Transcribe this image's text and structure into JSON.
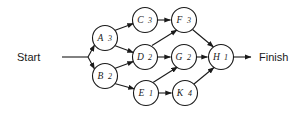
{
  "diagram": {
    "type": "activity-on-node-network",
    "terminals": {
      "start_label": "Start",
      "finish_label": "Finish"
    },
    "colors": {
      "stroke": "#1a1a1a",
      "node_fill": "#ffffff",
      "background": "#ffffff"
    },
    "nodes": [
      {
        "id": "A",
        "letter": "A",
        "duration": "3",
        "cx": 105,
        "cy": 38,
        "r": 12.5
      },
      {
        "id": "B",
        "letter": "B",
        "duration": "2",
        "cx": 105,
        "cy": 76,
        "r": 12.5
      },
      {
        "id": "C",
        "letter": "C",
        "duration": "3",
        "cx": 145,
        "cy": 20,
        "r": 12.5
      },
      {
        "id": "D",
        "letter": "D",
        "duration": "2",
        "cx": 145,
        "cy": 57,
        "r": 12.5
      },
      {
        "id": "E",
        "letter": "E",
        "duration": "1",
        "cx": 146,
        "cy": 93,
        "r": 12.5
      },
      {
        "id": "F",
        "letter": "F",
        "duration": "3",
        "cx": 184,
        "cy": 20,
        "r": 12.5
      },
      {
        "id": "G",
        "letter": "G",
        "duration": "2",
        "cx": 184,
        "cy": 57,
        "r": 12.5
      },
      {
        "id": "K",
        "letter": "K",
        "duration": "4",
        "cx": 185,
        "cy": 93,
        "r": 12.5
      },
      {
        "id": "H",
        "letter": "H",
        "duration": "1",
        "cx": 221,
        "cy": 57,
        "r": 12.5
      }
    ],
    "edges": [
      {
        "from": "Start",
        "to": "A"
      },
      {
        "from": "Start",
        "to": "B"
      },
      {
        "from": "A",
        "to": "C"
      },
      {
        "from": "A",
        "to": "D"
      },
      {
        "from": "B",
        "to": "D"
      },
      {
        "from": "B",
        "to": "E"
      },
      {
        "from": "C",
        "to": "F"
      },
      {
        "from": "D",
        "to": "F"
      },
      {
        "from": "D",
        "to": "G"
      },
      {
        "from": "E",
        "to": "G"
      },
      {
        "from": "E",
        "to": "K"
      },
      {
        "from": "F",
        "to": "H"
      },
      {
        "from": "G",
        "to": "H"
      },
      {
        "from": "K",
        "to": "H"
      },
      {
        "from": "H",
        "to": "Finish"
      }
    ]
  }
}
